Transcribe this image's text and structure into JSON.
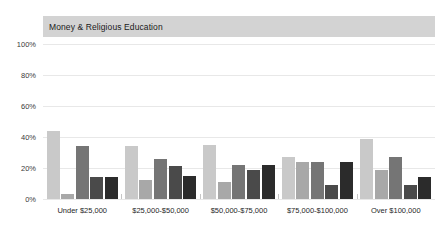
{
  "chart_data": {
    "type": "bar",
    "title": "Money & Religious Education",
    "xlabel": "",
    "ylabel": "",
    "ylim": [
      0,
      100
    ],
    "yticks": [
      "0%",
      "20%",
      "40%",
      "60%",
      "80%",
      "100%"
    ],
    "ytick_values": [
      0,
      20,
      40,
      60,
      80,
      100
    ],
    "grid": true,
    "legend": "none",
    "categories": [
      "Under $25,000",
      "$25,000-$50,000",
      "$50,000-$75,000",
      "$75,000-$100,000",
      "Over $100,000"
    ],
    "series": [
      {
        "name": "Series 1",
        "color": "#c9c9c9",
        "values": [
          44,
          34,
          35,
          27,
          39
        ]
      },
      {
        "name": "Series 2",
        "color": "#a8a8a8",
        "values": [
          3,
          12,
          11,
          24,
          19
        ]
      },
      {
        "name": "Series 3",
        "color": "#757575",
        "values": [
          34,
          26,
          22,
          24,
          27
        ]
      },
      {
        "name": "Series 4",
        "color": "#4a4a4a",
        "values": [
          14,
          21,
          19,
          9,
          9
        ]
      },
      {
        "name": "Series 5",
        "color": "#2b2b2b",
        "values": [
          14,
          15,
          22,
          24,
          14
        ]
      }
    ]
  },
  "colors": {
    "title_band": "#d3d3d3",
    "gridline": "#e8e8e8",
    "axis": "#b9b9b9",
    "background": "#ffffff",
    "text": "#1f1f1f"
  }
}
